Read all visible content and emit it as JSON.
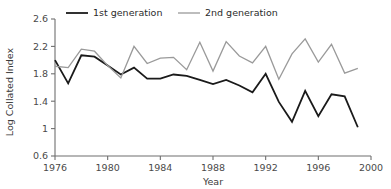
{
  "chart_data": {
    "type": "line",
    "title": "",
    "xlabel": "Year",
    "ylabel": "Log Collated Index",
    "xlim": [
      1976,
      2000
    ],
    "ylim": [
      0.6,
      2.6
    ],
    "xticks": [
      1976,
      1980,
      1984,
      1988,
      1992,
      1996,
      2000
    ],
    "xtick_labels": [
      "1976",
      "1980",
      "1984",
      "1988",
      "1992",
      "1996",
      "2000"
    ],
    "yticks": [
      0.6,
      1,
      1.4,
      1.8,
      2.2,
      2.6
    ],
    "ytick_labels": [
      "0.6",
      "1",
      "1.4",
      "1.8",
      "2.2",
      "2.6"
    ],
    "grid": false,
    "legend_position": "top-center",
    "x": [
      1976,
      1977,
      1978,
      1979,
      1980,
      1981,
      1982,
      1983,
      1984,
      1985,
      1986,
      1987,
      1988,
      1989,
      1990,
      1991,
      1992,
      1993,
      1994,
      1995,
      1996,
      1997,
      1998,
      1999
    ],
    "series": [
      {
        "name": "1st generation",
        "color": "#1a1a1a",
        "line_width": 1.8,
        "values": [
          2.0,
          1.66,
          2.07,
          2.05,
          1.92,
          1.79,
          1.89,
          1.73,
          1.73,
          1.79,
          1.77,
          1.71,
          1.65,
          1.71,
          1.63,
          1.53,
          1.8,
          1.39,
          1.1,
          1.55,
          1.18,
          1.5,
          1.47,
          1.02
        ]
      },
      {
        "name": "2nd generation",
        "color": "#9a9a9a",
        "line_width": 1.3,
        "values": [
          1.91,
          1.89,
          2.16,
          2.13,
          1.92,
          1.74,
          2.2,
          1.95,
          2.03,
          2.04,
          1.86,
          2.26,
          1.84,
          2.27,
          2.06,
          1.96,
          2.2,
          1.72,
          2.09,
          2.31,
          1.97,
          2.23,
          1.81,
          1.88
        ]
      }
    ]
  },
  "legend": {
    "items": [
      {
        "label": "1st generation"
      },
      {
        "label": "2nd generation"
      }
    ]
  }
}
